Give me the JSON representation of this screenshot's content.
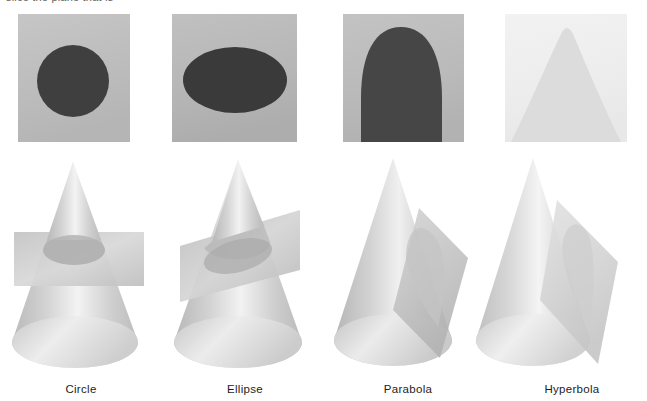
{
  "figure": {
    "clipped_heading_text": "slice the plane that is",
    "background_color": "#ffffff"
  },
  "sections": [
    {
      "id": "circle",
      "label": "Circle",
      "panel": {
        "background_color": "#c0c0c0",
        "shape": "circle",
        "shape_color": "#3f3f3f",
        "x": 18,
        "y": 14,
        "width": 112,
        "height": 128
      },
      "cone": {
        "plane_orientation": "horizontal",
        "plane_color": "#c8c8c8",
        "cone_color": "#d8d8d8",
        "x": 4,
        "y": 150,
        "width": 150,
        "height": 228
      },
      "caption_center_x": 81
    },
    {
      "id": "ellipse",
      "label": "Ellipse",
      "panel": {
        "background_color": "#b9b9b9",
        "shape": "ellipse",
        "shape_color": "#3a3a3a",
        "x": 172,
        "y": 14,
        "width": 125,
        "height": 128
      },
      "cone": {
        "plane_orientation": "tilted",
        "plane_color": "#c2c2c2",
        "cone_color": "#d8d8d8",
        "x": 158,
        "y": 150,
        "width": 152,
        "height": 228
      },
      "caption_center_x": 245
    },
    {
      "id": "parabola",
      "label": "Parabola",
      "panel": {
        "background_color": "#bdbdbd",
        "shape": "parabola",
        "shape_color": "#464646",
        "x": 343,
        "y": 14,
        "width": 121,
        "height": 128
      },
      "cone": {
        "plane_orientation": "vertical-parallel-to-side",
        "plane_color": "#cfcfcf",
        "cone_color": "#d8d8d8",
        "x": 320,
        "y": 150,
        "width": 155,
        "height": 228
      },
      "caption_center_x": 408
    },
    {
      "id": "hyperbola",
      "label": "Hyperbola",
      "panel": {
        "background_color": "#efefef",
        "shape": "hyperbola",
        "shape_color": "#dcdcdc",
        "x": 505,
        "y": 14,
        "width": 122,
        "height": 128
      },
      "cone": {
        "plane_orientation": "vertical-steep",
        "plane_color": "#dedede",
        "cone_color": "#dcdcdc",
        "x": 462,
        "y": 150,
        "width": 180,
        "height": 228
      },
      "caption_center_x": 572
    }
  ]
}
